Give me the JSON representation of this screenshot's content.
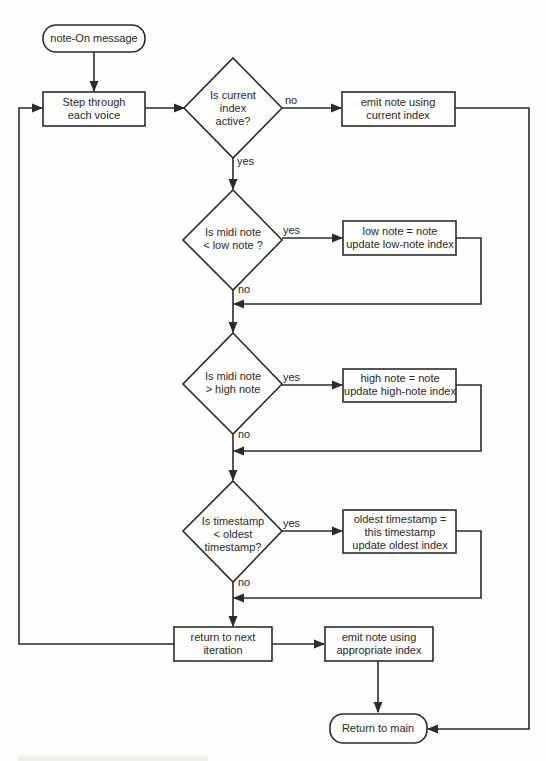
{
  "diagram": {
    "type": "flowchart",
    "nodes": {
      "start": {
        "kind": "terminal",
        "text": [
          "note-On message"
        ]
      },
      "step": {
        "kind": "process",
        "text": [
          "Step through",
          "each voice"
        ]
      },
      "d_active": {
        "kind": "decision",
        "text": [
          "Is current",
          "index",
          "active?"
        ]
      },
      "emit_current": {
        "kind": "process",
        "text": [
          "emit note using",
          "current index"
        ]
      },
      "d_low": {
        "kind": "decision",
        "text": [
          "Is midi note",
          "< low note ?"
        ]
      },
      "set_low": {
        "kind": "process",
        "text": [
          "low note = note",
          "update low-note index"
        ]
      },
      "d_high": {
        "kind": "decision",
        "text": [
          "Is midi note",
          "> high note"
        ]
      },
      "set_high": {
        "kind": "process",
        "text": [
          "high note = note",
          "update high-note index"
        ]
      },
      "d_oldest": {
        "kind": "decision",
        "text": [
          "Is timestamp",
          "< oldest",
          "timestamp?"
        ]
      },
      "set_oldest": {
        "kind": "process",
        "text": [
          "oldest timestamp =",
          "this timestamp",
          "update oldest index"
        ]
      },
      "next_iter": {
        "kind": "process",
        "text": [
          "return to next",
          "iteration"
        ]
      },
      "emit_appropriate": {
        "kind": "process",
        "text": [
          "emit note using",
          "appropriate index"
        ]
      },
      "end": {
        "kind": "terminal",
        "text": [
          "Return to main"
        ]
      }
    },
    "edges": [
      {
        "from": "start",
        "to": "step",
        "label": ""
      },
      {
        "from": "step",
        "to": "d_active",
        "label": ""
      },
      {
        "from": "d_active",
        "to": "emit_current",
        "label": "no"
      },
      {
        "from": "d_active",
        "to": "d_low",
        "label": "yes"
      },
      {
        "from": "emit_current",
        "to": "end",
        "label": ""
      },
      {
        "from": "d_low",
        "to": "set_low",
        "label": "yes"
      },
      {
        "from": "d_low",
        "to": "d_high",
        "label": "no"
      },
      {
        "from": "set_low",
        "to": "d_high",
        "label": ""
      },
      {
        "from": "d_high",
        "to": "set_high",
        "label": "yes"
      },
      {
        "from": "d_high",
        "to": "d_oldest",
        "label": "no"
      },
      {
        "from": "set_high",
        "to": "d_oldest",
        "label": ""
      },
      {
        "from": "d_oldest",
        "to": "set_oldest",
        "label": "yes"
      },
      {
        "from": "d_oldest",
        "to": "next_iter",
        "label": "no"
      },
      {
        "from": "set_oldest",
        "to": "next_iter",
        "label": ""
      },
      {
        "from": "next_iter",
        "to": "step",
        "label": ""
      },
      {
        "from": "next_iter",
        "to": "emit_appropriate",
        "label": ""
      },
      {
        "from": "emit_appropriate",
        "to": "end",
        "label": ""
      }
    ],
    "labels": {
      "yes": "yes",
      "no": "no"
    }
  }
}
